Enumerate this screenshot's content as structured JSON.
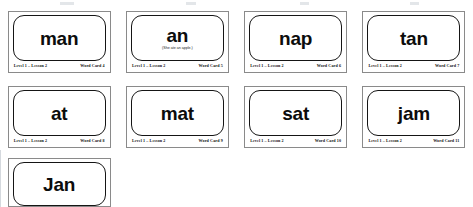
{
  "document": {
    "title": "Word Cards — Level 1 Lesson 2",
    "background_color": "#ffffff",
    "card_border_color": "#8a8a8a",
    "word_box_border_color": "#151515"
  },
  "labels": {
    "level_lesson": "Level 1 – Lesson 2"
  },
  "cards": [
    {
      "word": "man",
      "sentence": "",
      "level": "Level 1 – Lesson 2",
      "card_number": "Word Card 4",
      "row": 1,
      "column": 1
    },
    {
      "word": "an",
      "sentence": "(She ate an apple.)",
      "level": "Level 1 – Lesson 2",
      "card_number": "Word Card 5",
      "row": 1,
      "column": 2
    },
    {
      "word": "nap",
      "sentence": "",
      "level": "Level 1 – Lesson 2",
      "card_number": "Word Card 6",
      "row": 1,
      "column": 3
    },
    {
      "word": "tan",
      "sentence": "",
      "level": "Level 1 – Lesson 2",
      "card_number": "Word Card 7",
      "row": 1,
      "column": 4
    },
    {
      "word": "at",
      "sentence": "",
      "level": "Level 1 – Lesson 2",
      "card_number": "Word Card 8",
      "row": 2,
      "column": 1
    },
    {
      "word": "mat",
      "sentence": "",
      "level": "Level 1 – Lesson 2",
      "card_number": "Word Card 9",
      "row": 2,
      "column": 2
    },
    {
      "word": "sat",
      "sentence": "",
      "level": "Level 1 – Lesson 2",
      "card_number": "Word Card 10",
      "row": 2,
      "column": 3
    },
    {
      "word": "jam",
      "sentence": "",
      "level": "Level 1 – Lesson 2",
      "card_number": "Word Card 11",
      "row": 2,
      "column": 4
    },
    {
      "word": "Jan",
      "sentence": "",
      "level": "",
      "card_number": "",
      "row": 3,
      "column": 1
    }
  ]
}
